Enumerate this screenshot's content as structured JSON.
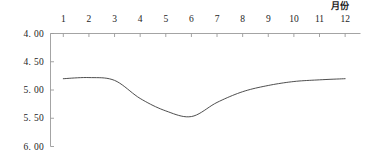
{
  "chart_data": {
    "type": "line",
    "title": "",
    "xlabel": "月份",
    "ylabel": "后南昌站地下水埋深/m",
    "categories": [
      "1",
      "2",
      "3",
      "4",
      "5",
      "6",
      "7",
      "8",
      "9",
      "10",
      "11",
      "12"
    ],
    "x": [
      1,
      2,
      3,
      4,
      5,
      6,
      7,
      8,
      9,
      10,
      11,
      12
    ],
    "values": [
      4.8,
      4.78,
      4.83,
      5.15,
      5.37,
      5.47,
      5.22,
      5.03,
      4.92,
      4.85,
      4.82,
      4.8
    ],
    "series": [
      {
        "name": "后南昌站地下水埋深",
        "values": [
          4.8,
          4.78,
          4.83,
          5.15,
          5.37,
          5.47,
          5.22,
          5.03,
          4.92,
          4.85,
          4.82,
          4.8
        ]
      }
    ],
    "ylim": [
      4.0,
      6.0
    ],
    "y_inverted": true,
    "yticks": [
      4.0,
      4.5,
      5.0,
      5.5,
      6.0
    ],
    "ytick_labels": [
      "4. 00",
      "4. 50",
      "5. 00",
      "5. 50",
      "6. 00"
    ],
    "xlim": [
      0.5,
      12.6
    ],
    "xaxis_position": "top",
    "grid": false,
    "legend": false,
    "line_color": "#3a3a3a",
    "axis_color": "#9a9a9a",
    "background": "#ffffff"
  },
  "axes": {
    "x_title": "月份",
    "y_title": "后南昌站地下水埋深/m"
  }
}
